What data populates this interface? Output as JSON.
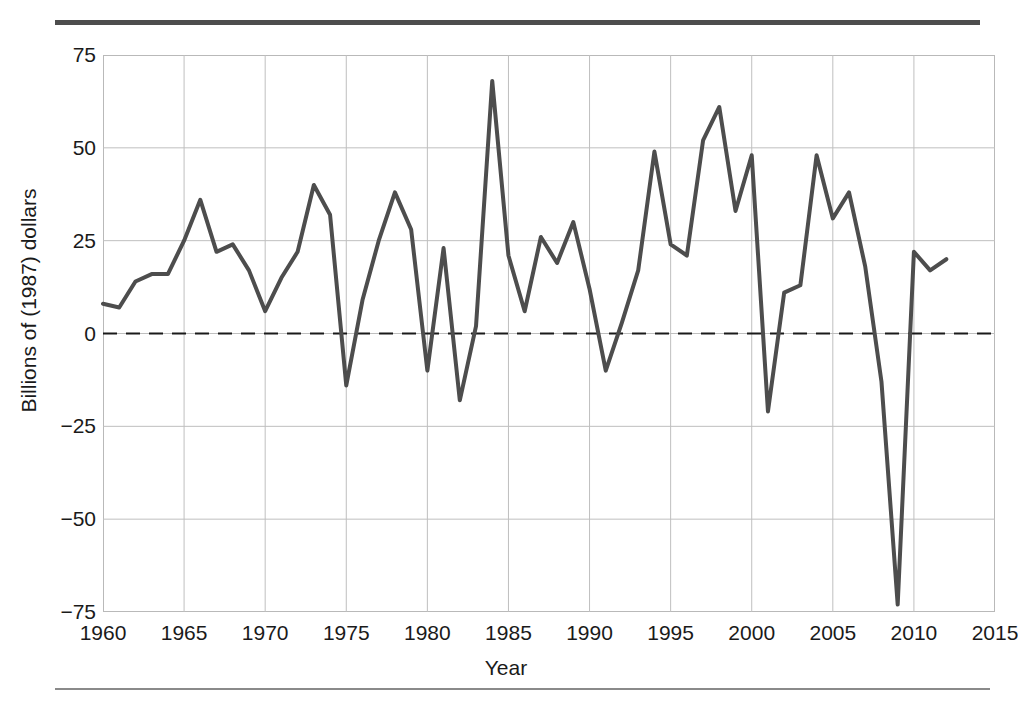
{
  "figure": {
    "background_color": "#ffffff",
    "top_rule_color": "#4d4d4d",
    "bottom_rule_color": "#8a8a8a"
  },
  "chart_data": {
    "type": "line",
    "title": "",
    "subtitle": "",
    "xlabel": "Year",
    "ylabel": "Billions of (1987) dollars",
    "xlim": [
      1960,
      2015
    ],
    "ylim": [
      -75,
      75
    ],
    "xticks": [
      1960,
      1965,
      1970,
      1975,
      1980,
      1985,
      1990,
      1995,
      2000,
      2005,
      2010,
      2015
    ],
    "xtick_labels": [
      "1960",
      "1965",
      "1970",
      "1975",
      "1980",
      "1985",
      "1990",
      "1995",
      "2000",
      "2005",
      "2010",
      "2015"
    ],
    "yticks": [
      -75,
      -50,
      -25,
      0,
      25,
      50,
      75
    ],
    "ytick_labels": [
      "−75",
      "−50",
      "−25",
      "0",
      "25",
      "50",
      "75"
    ],
    "grid": true,
    "grid_color": "#bfbfbf",
    "legend": "none",
    "annotations": [
      {
        "kind": "zero-reference-line",
        "y": 0,
        "style": "dashed",
        "color": "#1a1a1a"
      }
    ],
    "series": [
      {
        "name": "",
        "color": "#4d4d4d",
        "line_width": 4,
        "x": [
          1960,
          1961,
          1962,
          1963,
          1964,
          1965,
          1966,
          1967,
          1968,
          1969,
          1970,
          1971,
          1972,
          1973,
          1974,
          1975,
          1976,
          1977,
          1978,
          1979,
          1980,
          1981,
          1982,
          1983,
          1984,
          1985,
          1986,
          1987,
          1988,
          1989,
          1990,
          1991,
          1992,
          1993,
          1994,
          1995,
          1996,
          1997,
          1998,
          1999,
          2000,
          2001,
          2002,
          2003,
          2004,
          2005,
          2006,
          2007,
          2008,
          2009,
          2010,
          2011,
          2012
        ],
        "values": [
          8,
          7,
          14,
          16,
          16,
          25,
          36,
          22,
          24,
          17,
          6,
          15,
          22,
          40,
          32,
          -14,
          9,
          25,
          38,
          28,
          -10,
          23,
          -18,
          2,
          68,
          21,
          6,
          26,
          19,
          30,
          12,
          -10,
          3,
          17,
          49,
          24,
          21,
          52,
          61,
          33,
          48,
          -21,
          11,
          13,
          48,
          31,
          38,
          18,
          -13,
          -73,
          22,
          17,
          20
        ]
      }
    ]
  },
  "axes": {
    "y_title": "Billions of (1987) dollars",
    "x_title": "Year"
  }
}
